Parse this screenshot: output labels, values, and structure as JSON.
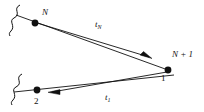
{
  "figure": {
    "type": "diagram",
    "background_color": "#ffffff",
    "stroke_color": "#111111",
    "nodes": [
      {
        "id": "N",
        "label": "N",
        "label_style": "italic",
        "x": 35,
        "y": 23
      },
      {
        "id": "N+1",
        "label": "N + 1",
        "label_style": "italic",
        "x": 168,
        "y": 70
      },
      {
        "id": "2",
        "label": "2",
        "label_style": "upright",
        "x": 37,
        "y": 90
      }
    ],
    "edge_labels": [
      {
        "id": "tN",
        "base": "t",
        "sub": "N",
        "x": 95,
        "y": 20
      },
      {
        "id": "t1",
        "base": "t",
        "sub": "1",
        "x": 105,
        "y": 93
      }
    ],
    "port_labels": [
      {
        "id": "one",
        "label": "1",
        "label_style": "upright",
        "x": 161,
        "y": 74
      }
    ],
    "break_marks": [
      {
        "id": "break-top",
        "x": 10,
        "y": 6
      },
      {
        "id": "break-bottom",
        "x": 12,
        "y": 76
      }
    ],
    "arrows": [
      {
        "id": "arrow-tN",
        "from": "N",
        "to": "N+1",
        "direction": "down-right"
      },
      {
        "id": "arrow-t1",
        "from": "N+1",
        "to": "2",
        "direction": "left"
      }
    ]
  }
}
